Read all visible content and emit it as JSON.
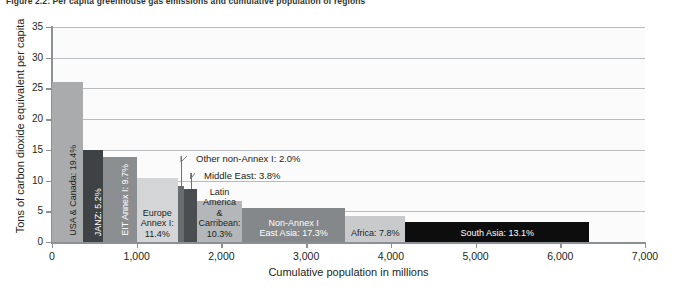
{
  "figure": {
    "title": "Figure 2.2: Per capita greenhouse gas emissions and cumulative population of regions"
  },
  "chart_data": {
    "type": "bar",
    "title": "Figure 2.2: Per capita greenhouse gas emissions and cumulative population of regions",
    "xlabel": "Cumulative population in millions",
    "ylabel": "Tons of carbon dioxide equivalent per capita",
    "xlim": [
      0,
      7000
    ],
    "ylim": [
      0,
      35
    ],
    "xticks": [
      "0",
      "1,000",
      "2,000",
      "3,000",
      "4,000",
      "5,000",
      "6,000",
      "7,000"
    ],
    "yticks": [
      "0",
      "5",
      "10",
      "15",
      "20",
      "25",
      "30",
      "35"
    ],
    "grid": "horizontal",
    "legend": "none",
    "note": "Variable-width bars: width = regional population share (cumulative population in millions), height = per capita GHG emissions",
    "bars": [
      {
        "name": "USA & Canada",
        "label": "USA & Canada: 19.4%",
        "share_pct": 19.4,
        "pop_start": 0,
        "pop_end": 370,
        "per_capita": 26.0,
        "color": "#a9abad",
        "text_color": "#231f20",
        "orientation": "vertical"
      },
      {
        "name": "JANZ",
        "label": "JANZ: 5.2%",
        "share_pct": 5.2,
        "pop_start": 370,
        "pop_end": 600,
        "per_capita": 15.0,
        "color": "#3f4245",
        "text_color": "#ffffff",
        "orientation": "vertical"
      },
      {
        "name": "EIT Annex I",
        "label": "EIT Annex I: 9.7%",
        "share_pct": 9.7,
        "pop_start": 600,
        "pop_end": 1000,
        "per_capita": 13.8,
        "color": "#8b8e90",
        "text_color": "#ffffff",
        "orientation": "vertical"
      },
      {
        "name": "Europe Annex II & M&T",
        "label": "Europe\nAnnex I:\n11.4%",
        "share_pct": 11.4,
        "pop_start": 1000,
        "pop_end": 1485,
        "per_capita": 10.5,
        "color": "#d3d5d6",
        "text_color": "#231f20",
        "orientation": "horizontal"
      },
      {
        "name": "Other non-Annex I",
        "label": "Other non-Annex I: 2.0%",
        "share_pct": 2.0,
        "pop_start": 1485,
        "pop_end": 1560,
        "per_capita": 9.1,
        "color": "#6a6d70",
        "text_color": "#231f20",
        "orientation": "callout"
      },
      {
        "name": "Middle East",
        "label": "Middle East: 3.8%",
        "share_pct": 3.8,
        "pop_start": 1560,
        "pop_end": 1710,
        "per_capita": 8.7,
        "color": "#4b4e51",
        "text_color": "#231f20",
        "orientation": "callout"
      },
      {
        "name": "Latin America & Carribean",
        "label": "Latin\nAmerica\n&\nCarribean:\n10.3%",
        "share_pct": 10.3,
        "pop_start": 1710,
        "pop_end": 2245,
        "per_capita": 6.6,
        "color": "#b4b7b9",
        "text_color": "#231f20",
        "orientation": "horizontal"
      },
      {
        "name": "Non-Annex I East Asia",
        "label": "Non-Annex I\nEast Asia: 17.3%",
        "share_pct": 17.3,
        "pop_start": 2245,
        "pop_end": 3460,
        "per_capita": 5.5,
        "color": "#85888a",
        "text_color": "#ffffff",
        "orientation": "horizontal"
      },
      {
        "name": "Africa",
        "label": "Africa: 7.8%",
        "share_pct": 7.8,
        "pop_start": 3460,
        "pop_end": 4170,
        "per_capita": 4.3,
        "color": "#c8cacb",
        "text_color": "#231f20",
        "orientation": "horizontal"
      },
      {
        "name": "South Asia",
        "label": "South Asia: 13.1%",
        "share_pct": 13.1,
        "pop_start": 4170,
        "pop_end": 6340,
        "per_capita": 3.2,
        "color": "#0d0d0d",
        "text_color": "#ffffff",
        "orientation": "horizontal"
      }
    ]
  }
}
